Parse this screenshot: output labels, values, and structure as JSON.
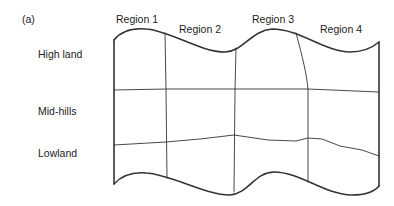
{
  "figure": {
    "panel_label": "(a)",
    "regions": [
      {
        "label": "Region   1"
      },
      {
        "label": "Region  2"
      },
      {
        "label": "Region  3"
      },
      {
        "label": "Region 4"
      }
    ],
    "zones": [
      {
        "label": "High land"
      },
      {
        "label": "Mid-hills"
      },
      {
        "label": "Lowland"
      }
    ],
    "colors": {
      "line": "#333333",
      "text": "#222222",
      "background": "#ffffff"
    }
  }
}
